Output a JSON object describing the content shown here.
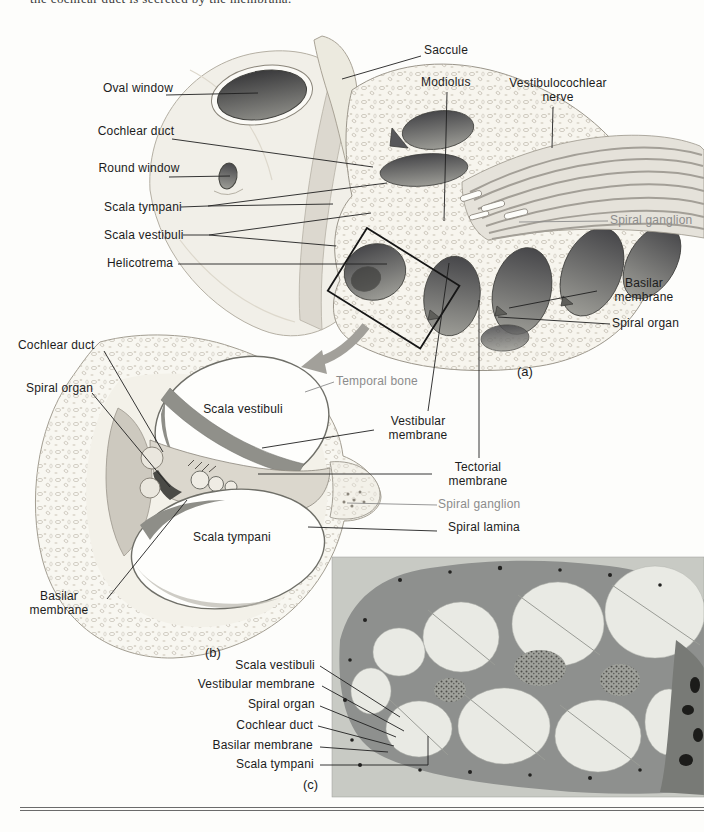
{
  "page": {
    "clipped_top_text": "the cochlear duct is secreted by the membrana.",
    "colors": {
      "label_black": "#1c1c1c",
      "label_gray": "#8c8c8c",
      "bone_white": "#f7f5ee",
      "chamber_dark": "#4e4e4b",
      "photo_background": "#c8cac4",
      "photo_tissue": "#8e908e",
      "rule_gray": "#6b6b6b"
    }
  },
  "panel_a": {
    "tag": "(a)",
    "labels": {
      "saccule": "Saccule",
      "modiolus": "Modiolus",
      "vestibulocochlear_nerve": "Vestibulocochlear nerve",
      "oval_window": "Oval window",
      "cochlear_duct": "Cochlear duct",
      "round_window": "Round window",
      "scala_tympani": "Scala tympani",
      "scala_vestibuli": "Scala vestibuli",
      "helicotrema": "Helicotrema",
      "spiral_ganglion": "Spiral ganglion",
      "basilar_membrane": "Basilar membrane",
      "spiral_organ": "Spiral organ"
    }
  },
  "panel_b": {
    "tag": "(b)",
    "labels": {
      "cochlear_duct": "Cochlear duct",
      "spiral_organ": "Spiral organ",
      "temporal_bone": "Temporal bone",
      "scala_vestibuli": "Scala vestibuli",
      "vestibular_membrane": "Vestibular membrane",
      "tectorial_membrane": "Tectorial membrane",
      "spiral_ganglion": "Spiral ganglion",
      "spiral_lamina": "Spiral lamina",
      "scala_tympani": "Scala tympani",
      "basilar_membrane": "Basilar membrane"
    }
  },
  "panel_c": {
    "tag": "(c)",
    "labels": {
      "scala_vestibuli": "Scala vestibuli",
      "vestibular_membrane": "Vestibular membrane",
      "spiral_organ": "Spiral organ",
      "cochlear_duct": "Cochlear duct",
      "basilar_membrane": "Basilar membrane",
      "scala_tympani": "Scala tympani"
    }
  }
}
